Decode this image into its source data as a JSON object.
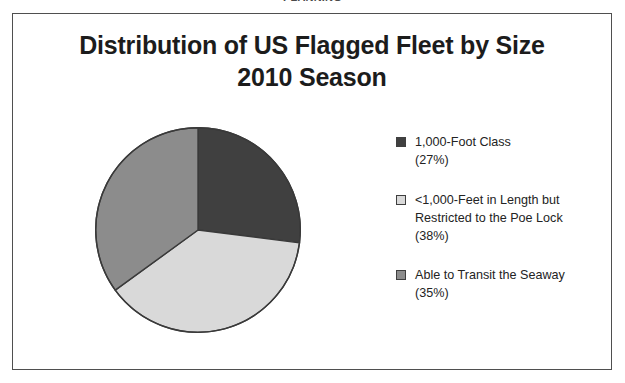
{
  "clipped_header_text": "PLANNING",
  "frame": {
    "border_color": "#4f4f4f",
    "background": "#ffffff"
  },
  "chart_title": {
    "line1": "Distribution of US Flagged Fleet by Size",
    "line2": "2010 Season"
  },
  "chart_data": {
    "type": "pie",
    "title": "Distribution of US Flagged Fleet by Size 2010 Season",
    "xlabel": "",
    "ylabel": "",
    "legend_position": "right",
    "grid": false,
    "start_angle_deg": 0,
    "direction": "clockwise",
    "categories": [
      "1,000-Foot Class",
      "<1,000-Feet in Length but Restricted to the Poe Lock",
      "Able to Transit the Seaway"
    ],
    "values": [
      27,
      38,
      35
    ],
    "value_unit": "%",
    "colors": [
      "#404040",
      "#d9d9d9",
      "#8c8c8c"
    ],
    "slices": [
      {
        "label": "1,000-Foot Class",
        "label_line1": "1,000-Foot Class",
        "percent_label": "(27%)",
        "value": 27,
        "color": "#404040",
        "start_deg": 0,
        "end_deg": 97.2
      },
      {
        "label": "<1,000-Feet in Length but Restricted to the Poe Lock",
        "label_line1": "<1,000-Feet in Length but",
        "label_line2": "Restricted to the Poe Lock",
        "percent_label": "(38%)",
        "value": 38,
        "color": "#d9d9d9",
        "start_deg": 97.2,
        "end_deg": 234.0
      },
      {
        "label": "Able to Transit the Seaway",
        "label_line1": "Able to Transit the Seaway",
        "percent_label": "(35%)",
        "value": 35,
        "color": "#8c8c8c",
        "start_deg": 234.0,
        "end_deg": 360.0
      }
    ]
  },
  "legend": [
    {
      "swatch_color": "#404040",
      "line1": "1,000-Foot Class",
      "line2": "",
      "percent": "(27%)"
    },
    {
      "swatch_color": "#d9d9d9",
      "line1": "<1,000-Feet in Length but",
      "line2": "Restricted to the Poe Lock",
      "percent": "(38%)"
    },
    {
      "swatch_color": "#8c8c8c",
      "line1": "Able to Transit the Seaway",
      "line2": "",
      "percent": "(35%)"
    }
  ]
}
